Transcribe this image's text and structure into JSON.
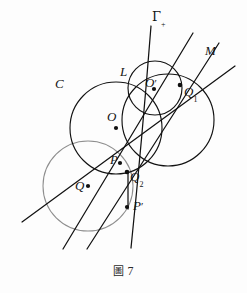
{
  "figure": {
    "caption_label": "圖",
    "caption_number": "7",
    "background_bleed_text_line1": "            ",
    "background_bleed_text_line2": "         "
  },
  "labels": {
    "gamma_plus": {
      "base": "Γ",
      "sub": "+",
      "x": 152,
      "y": 16
    },
    "line_m": {
      "base": "M",
      "x": 205,
      "y": 49
    },
    "circle_c": {
      "base": "C",
      "x": 57,
      "y": 82
    },
    "point_l": {
      "base": "L",
      "x": 121,
      "y": 70
    },
    "center_o": {
      "base": "O",
      "x": 108,
      "y": 116
    },
    "point_o_prime": {
      "base": "O",
      "prime": "′",
      "x": 147,
      "y": 81
    },
    "point_q1": {
      "base": "Q",
      "sub": "1",
      "x": 186,
      "y": 90
    },
    "point_p": {
      "base": "P",
      "x": 111,
      "y": 158
    },
    "point_q2": {
      "base": "Q",
      "sub": "2",
      "x": 130,
      "y": 174
    },
    "center_q": {
      "base": "Q",
      "x": 76,
      "y": 184
    },
    "point_p_prime": {
      "base": "P",
      "prime": "′",
      "x": 134,
      "y": 203
    }
  },
  "geometry": {
    "circles": [
      {
        "name": "circle-C",
        "cx": 116,
        "cy": 128,
        "r": 46,
        "stroke": "#121212"
      },
      {
        "name": "circle-O-prime",
        "cx": 155,
        "cy": 88,
        "r": 27,
        "stroke": "#121212"
      },
      {
        "name": "circle-gamma-large",
        "cx": 168,
        "cy": 120,
        "r": 46,
        "stroke": "#121212"
      },
      {
        "name": "circle-Q",
        "cx": 88,
        "cy": 186,
        "r": 45,
        "stroke": "#8e8e8e"
      }
    ],
    "points": [
      {
        "name": "point-O",
        "cx": 116,
        "cy": 128
      },
      {
        "name": "point-O-prime",
        "cx": 154,
        "cy": 89
      },
      {
        "name": "point-Q1",
        "cx": 180,
        "cy": 85
      },
      {
        "name": "point-P",
        "cx": 120,
        "cy": 163
      },
      {
        "name": "point-Q2",
        "cx": 127,
        "cy": 172
      },
      {
        "name": "point-Q",
        "cx": 88,
        "cy": 186
      },
      {
        "name": "point-P-prime",
        "cx": 127,
        "cy": 207
      }
    ],
    "lines": [
      {
        "name": "line-gamma-plus",
        "x1": 151,
        "y1": 26,
        "x2": 131,
        "y2": 248
      },
      {
        "name": "line-through-Q1-steep",
        "x1": 193,
        "y1": 33,
        "x2": 63,
        "y2": 249
      },
      {
        "name": "line-M",
        "x1": 219,
        "y1": 43,
        "x2": 87,
        "y2": 249
      },
      {
        "name": "line-secant-low",
        "x1": 235,
        "y1": 66,
        "x2": 22,
        "y2": 222
      }
    ]
  },
  "colors": {
    "ink": "#121212",
    "gray_ink": "#8e8e8e",
    "paper": "#fdfdfd"
  }
}
